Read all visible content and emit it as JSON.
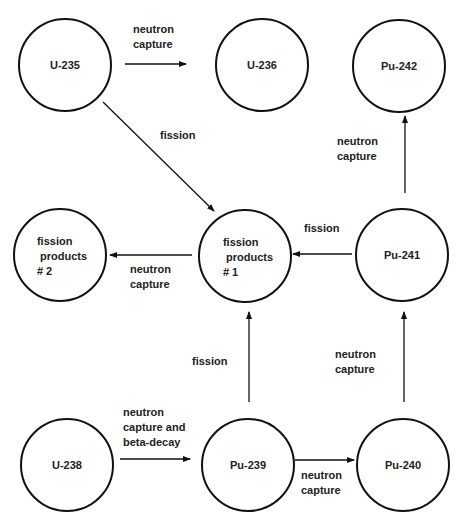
{
  "diagram": {
    "title": "",
    "colors": {
      "stroke": "#111111",
      "text": "#222222",
      "background": "#ffffff"
    },
    "nodes": [
      {
        "id": "u235",
        "label": "U-235",
        "cx": 65,
        "cy": 65,
        "r": 46
      },
      {
        "id": "u236",
        "label": "U-236",
        "cx": 262,
        "cy": 65,
        "r": 46
      },
      {
        "id": "pu242",
        "label": "Pu-242",
        "cx": 399,
        "cy": 66,
        "r": 46
      },
      {
        "id": "fp2",
        "label": "fission\n products\n# 2",
        "cx": 60,
        "cy": 255,
        "r": 46
      },
      {
        "id": "fp1",
        "label": "fission\n products\n# 1",
        "cx": 245,
        "cy": 256,
        "r": 46
      },
      {
        "id": "pu241",
        "label": "Pu-241",
        "cx": 402,
        "cy": 255,
        "r": 46
      },
      {
        "id": "u238",
        "label": "U-238",
        "cx": 67,
        "cy": 465,
        "r": 46
      },
      {
        "id": "pu239",
        "label": "Pu-239",
        "cx": 248,
        "cy": 465,
        "r": 46
      },
      {
        "id": "pu240",
        "label": "Pu-240",
        "cx": 403,
        "cy": 465,
        "r": 46
      }
    ],
    "edges": [
      {
        "from": "u235",
        "to": "u236",
        "label": "neutron\ncapture"
      },
      {
        "from": "u235",
        "to": "fp1",
        "label": "fission"
      },
      {
        "from": "pu241",
        "to": "pu242",
        "label": "neutron\ncapture"
      },
      {
        "from": "fp1",
        "to": "fp2",
        "label": "neutron\ncapture"
      },
      {
        "from": "pu241",
        "to": "fp1",
        "label": "fission"
      },
      {
        "from": "pu239",
        "to": "fp1",
        "label": "fission"
      },
      {
        "from": "pu240",
        "to": "pu241",
        "label": "neutron\ncapture"
      },
      {
        "from": "u238",
        "to": "pu239",
        "label": "neutron\ncapture and\nbeta-decay"
      },
      {
        "from": "pu239",
        "to": "pu240",
        "label": "neutron\ncapture"
      }
    ]
  }
}
